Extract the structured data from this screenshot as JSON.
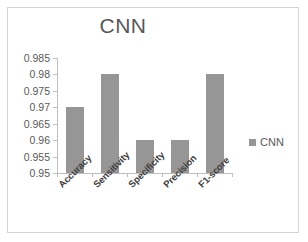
{
  "chart_data": {
    "type": "bar",
    "title": "CNN",
    "xlabel": "",
    "ylabel": "",
    "categories": [
      "Accuracy",
      "Sensitivity",
      "Specificity",
      "Precision",
      "F1-score"
    ],
    "values": [
      0.97,
      0.98,
      0.96,
      0.96,
      0.98
    ],
    "series": [
      {
        "name": "CNN",
        "values": [
          0.97,
          0.98,
          0.96,
          0.96,
          0.98
        ],
        "color": "#969696"
      }
    ],
    "ylim": [
      0.95,
      0.985
    ],
    "ytick_step": 0.005,
    "ytick_labels": [
      "0.985",
      "0.98",
      "0.975",
      "0.97",
      "0.965",
      "0.96",
      "0.955",
      "0.95"
    ],
    "ytick_values": [
      0.985,
      0.98,
      0.975,
      0.97,
      0.965,
      0.96,
      0.955,
      0.95
    ],
    "grid": false,
    "legend": {
      "position": "right",
      "entries": [
        {
          "label": "CNN",
          "color": "#969696"
        }
      ]
    },
    "colors": {
      "bar": "#969696",
      "axis": "#bfbfbf",
      "title_text": "#595959",
      "tick_text": "#595959",
      "category_text": "#404040",
      "frame_border": "#d4d4d4",
      "background": "#ffffff"
    }
  }
}
